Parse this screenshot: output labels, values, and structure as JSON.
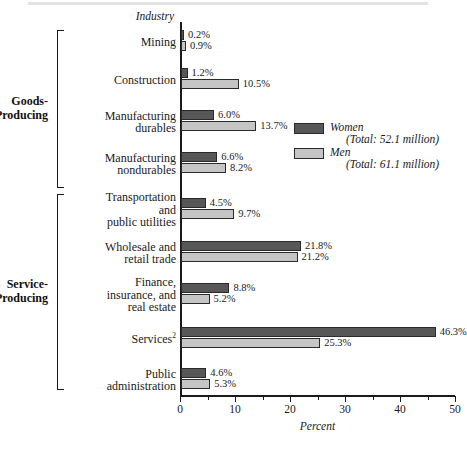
{
  "axis": {
    "y_axis_title": "Industry",
    "x_axis_title": "Percent",
    "x_ticks": [
      "0",
      "10",
      "20",
      "30",
      "40",
      "50"
    ]
  },
  "legend": {
    "women": {
      "name": "Women",
      "total": "(Total: 52.1 million)",
      "color": "#575757"
    },
    "men": {
      "name": "Men",
      "total": "(Total: 61.1 million)",
      "color": "#c5c5c5"
    }
  },
  "groups": [
    {
      "label": "Goods-\nProducing",
      "line1": "Goods-",
      "line2": "Producing"
    },
    {
      "label": "Service-\nProducing",
      "line1": "Service-",
      "line2": "Producing"
    }
  ],
  "categories": [
    {
      "label": "Mining",
      "lines": [
        "Mining"
      ]
    },
    {
      "label": "Construction",
      "lines": [
        "Construction"
      ]
    },
    {
      "label": "Manufacturing durables",
      "lines": [
        "Manufacturing",
        "durables"
      ]
    },
    {
      "label": "Manufacturing nondurables",
      "lines": [
        "Manufacturing",
        "nondurables"
      ]
    },
    {
      "label": "Transportation and public utilities",
      "lines": [
        "Transportation",
        "and",
        "public utilities"
      ]
    },
    {
      "label": "Wholesale and retail trade",
      "lines": [
        "Wholesale and",
        "retail trade"
      ]
    },
    {
      "label": "Finance, insurance, and real estate",
      "lines": [
        "Finance,",
        "insurance, and",
        "real estate"
      ]
    },
    {
      "label": "Services",
      "lines": [
        "Services"
      ],
      "superscript": "2"
    },
    {
      "label": "Public administration",
      "lines": [
        "Public",
        "administration"
      ]
    }
  ],
  "labels": {
    "women": [
      "0.2%",
      "1.2%",
      "6.0%",
      "6.6%",
      "4.5%",
      "21.8%",
      "8.8%",
      "46.3%",
      "4.6%"
    ],
    "men": [
      "0.9%",
      "10.5%",
      "13.7%",
      "8.2%",
      "9.7%",
      "21.2%",
      "5.2%",
      "25.3%",
      "5.3%"
    ]
  },
  "footnote": "",
  "chart_data": {
    "type": "bar",
    "orientation": "horizontal",
    "title": "",
    "xlabel": "Percent",
    "ylabel": "Industry",
    "xlim": [
      0,
      50
    ],
    "xticks": [
      0,
      10,
      20,
      30,
      40,
      50
    ],
    "minor_tick_interval": 5,
    "grid": false,
    "legend_position": "upper right",
    "categories": [
      "Mining",
      "Construction",
      "Manufacturing durables",
      "Manufacturing nondurables",
      "Transportation and public utilities",
      "Wholesale and retail trade",
      "Finance, insurance, and real estate",
      "Services",
      "Public administration"
    ],
    "category_groups": [
      {
        "name": "Goods-Producing",
        "categories": [
          "Mining",
          "Construction",
          "Manufacturing durables",
          "Manufacturing nondurables"
        ]
      },
      {
        "name": "Service-Producing",
        "categories": [
          "Transportation and public utilities",
          "Wholesale and retail trade",
          "Finance, insurance, and real estate",
          "Services",
          "Public administration"
        ]
      }
    ],
    "series": [
      {
        "name": "Women",
        "total": "52.1 million",
        "color": "#575757",
        "values": [
          0.2,
          1.2,
          6.0,
          6.6,
          4.5,
          21.8,
          8.8,
          46.3,
          4.6
        ]
      },
      {
        "name": "Men",
        "total": "61.1 million",
        "color": "#c5c5c5",
        "values": [
          0.9,
          10.5,
          13.7,
          8.2,
          9.7,
          21.2,
          5.2,
          25.3,
          5.3
        ]
      }
    ]
  }
}
